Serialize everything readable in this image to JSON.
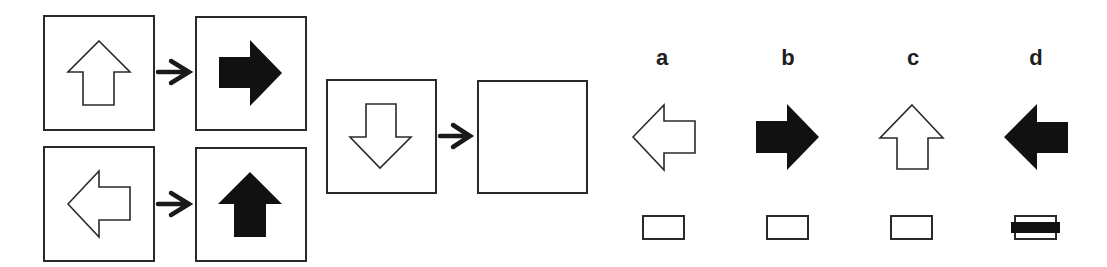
{
  "puzzle": {
    "type": "visual-analogy",
    "examples": [
      {
        "input": {
          "shape": "arrow",
          "direction": "up",
          "fill": "outline"
        },
        "output": {
          "shape": "arrow",
          "direction": "right",
          "fill": "solid"
        }
      },
      {
        "input": {
          "shape": "arrow",
          "direction": "left",
          "fill": "outline"
        },
        "output": {
          "shape": "arrow",
          "direction": "up",
          "fill": "solid"
        }
      }
    ],
    "question": {
      "input": {
        "shape": "arrow",
        "direction": "down",
        "fill": "outline"
      },
      "output": "blank"
    },
    "transform_icon": "right-arrow-connector",
    "colors": {
      "stroke": "#2a2a2a",
      "fill_solid": "#111111",
      "background": "#ffffff"
    }
  },
  "options": [
    {
      "label": "a",
      "direction": "left",
      "fill": "outline",
      "marked": false
    },
    {
      "label": "b",
      "direction": "right",
      "fill": "solid",
      "marked": false
    },
    {
      "label": "c",
      "direction": "up",
      "fill": "outline",
      "marked": false
    },
    {
      "label": "d",
      "direction": "left",
      "fill": "solid",
      "marked": true
    }
  ]
}
